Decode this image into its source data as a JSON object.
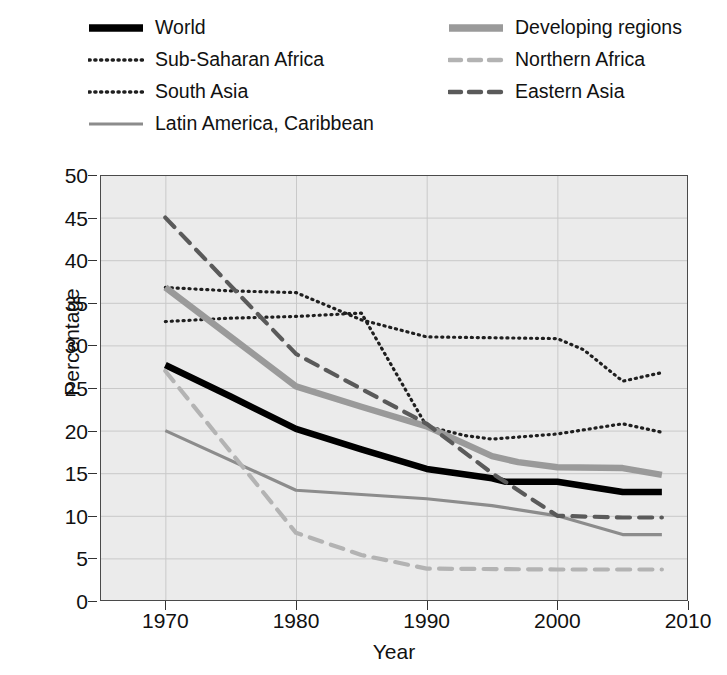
{
  "chart_data": {
    "type": "line",
    "title": "",
    "xlabel": "Year",
    "ylabel": "Percentage",
    "xlim": [
      1965,
      2010
    ],
    "ylim": [
      0,
      50
    ],
    "xticks": [
      1970,
      1980,
      1990,
      2000,
      2010
    ],
    "yticks": [
      0,
      5,
      10,
      15,
      20,
      25,
      30,
      35,
      40,
      45,
      50
    ],
    "grid": true,
    "legend_position": "above-plot",
    "series": [
      {
        "name": "World",
        "style": "solid",
        "color": "#000000",
        "width": 6.5,
        "x": [
          1970,
          1975,
          1980,
          1985,
          1990,
          1995,
          1996,
          2000,
          2005,
          2008
        ],
        "values": [
          27.7,
          24.0,
          20.2,
          17.8,
          15.5,
          14.4,
          14.0,
          14.0,
          12.8,
          12.8
        ]
      },
      {
        "name": "Sub-Saharan Africa",
        "style": "dotted",
        "color": "#1f1f1f",
        "width": 3.2,
        "x": [
          1970,
          1975,
          1980,
          1985,
          1988,
          1990,
          1995,
          2000,
          2002,
          2005,
          2008
        ],
        "values": [
          36.8,
          36.4,
          36.2,
          33.0,
          31.8,
          31.0,
          30.9,
          30.8,
          29.5,
          25.8,
          26.8
        ]
      },
      {
        "name": "South Asia",
        "style": "dotted",
        "color": "#1f1f1f",
        "width": 3.2,
        "x": [
          1970,
          1975,
          1980,
          1985,
          1990,
          1993,
          1995,
          2000,
          2005,
          2008
        ],
        "values": [
          32.8,
          33.2,
          33.4,
          33.8,
          20.5,
          19.4,
          19.0,
          19.6,
          20.8,
          19.8
        ]
      },
      {
        "name": "Latin America, Caribbean",
        "style": "solid",
        "color": "#8c8c8c",
        "width": 3.2,
        "x": [
          1970,
          1980,
          1990,
          1995,
          2000,
          2005,
          2008
        ],
        "values": [
          20.0,
          13.0,
          12.0,
          11.2,
          10.0,
          7.8,
          7.8
        ]
      },
      {
        "name": "Developing regions",
        "style": "solid",
        "color": "#9a9a9a",
        "width": 6.5,
        "x": [
          1970,
          1975,
          1980,
          1985,
          1990,
          1995,
          1997,
          2000,
          2005,
          2008
        ],
        "values": [
          36.8,
          31.0,
          25.2,
          22.8,
          20.5,
          17.0,
          16.3,
          15.7,
          15.6,
          14.8
        ]
      },
      {
        "name": "Northern Africa",
        "style": "dashed",
        "color": "#b3b3b3",
        "width": 4.2,
        "x": [
          1970,
          1980,
          1985,
          1990,
          2000,
          2008
        ],
        "values": [
          27.0,
          8.0,
          5.4,
          3.8,
          3.7,
          3.7
        ]
      },
      {
        "name": "Eastern Asia",
        "style": "dashed",
        "color": "#5a5a5a",
        "width": 4.2,
        "x": [
          1970,
          1980,
          1990,
          1995,
          2000,
          2005,
          2008
        ],
        "values": [
          45.0,
          29.0,
          20.8,
          15.0,
          10.0,
          9.8,
          9.8
        ]
      }
    ]
  },
  "legend": {
    "items": [
      {
        "label": "World",
        "swatch": "solid-thick-black",
        "col": 0,
        "row": 0
      },
      {
        "label": "Sub-Saharan Africa",
        "swatch": "dotted-black",
        "col": 0,
        "row": 1
      },
      {
        "label": "South Asia",
        "swatch": "dotted-black",
        "col": 0,
        "row": 2
      },
      {
        "label": "Latin America, Caribbean",
        "swatch": "solid-thin-gray",
        "col": 0,
        "row": 3
      },
      {
        "label": "Developing regions",
        "swatch": "solid-thick-gray",
        "col": 1,
        "row": 0
      },
      {
        "label": "Northern Africa",
        "swatch": "dashed-lightgray",
        "col": 1,
        "row": 1
      },
      {
        "label": "Eastern Asia",
        "swatch": "dashed-darkgray",
        "col": 1,
        "row": 2
      }
    ]
  },
  "axes": {
    "x_title": "Year",
    "y_title": "Percentage",
    "x_tick_labels": [
      "1970",
      "1980",
      "1990",
      "2000",
      "2010"
    ],
    "y_tick_labels": [
      "0",
      "5",
      "10",
      "15",
      "20",
      "25",
      "30",
      "35",
      "40",
      "45",
      "50"
    ]
  },
  "colors": {
    "plot_background": "#ebebeb",
    "grid": "#c9c9c9",
    "frame": "#4a4a4a",
    "text": "#111111"
  }
}
